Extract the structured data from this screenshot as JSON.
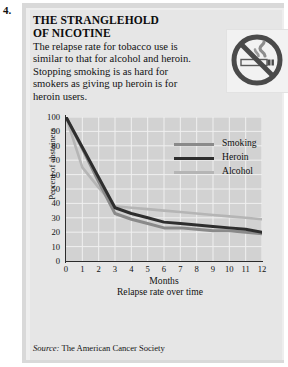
{
  "item_number": "4.",
  "panel": {
    "title": "THE STRANGLEHOLD OF NICOTINE",
    "title_line1": "THE STRANGLEHOLD",
    "title_line2": "OF NICOTINE",
    "body": "The relapse rate for tobacco use is similar to that for alcohol and heroin. Stopping smoking is as hard for smokers as giving up heroin is for heroin users.",
    "icon_name": "no-smoking-icon",
    "source_prefix": "Source:",
    "source_text": "The American Cancer Society"
  },
  "colors": {
    "panel_bg": "#e6e6e6",
    "plot_bg": "#d2d2d2",
    "grid": "#f0f0f0",
    "axis": "#2b2b2b",
    "smoking": "#8a8a8a",
    "heroin": "#2e2e2e",
    "alcohol": "#b5b5b5"
  },
  "chart_data": {
    "type": "line",
    "title": "",
    "xlabel": "Months",
    "xsubtitle": "Relapse rate over time",
    "ylabel": "Percent of abstainers",
    "xlim": [
      0,
      12
    ],
    "ylim": [
      0,
      100
    ],
    "xticks": [
      0,
      1,
      2,
      3,
      4,
      5,
      6,
      7,
      8,
      9,
      10,
      11,
      12
    ],
    "yticks": [
      0,
      10,
      20,
      30,
      40,
      50,
      60,
      70,
      80,
      90,
      100
    ],
    "grid": true,
    "legend_position": "upper-right-inside",
    "x": [
      0,
      1,
      2,
      3,
      4,
      5,
      6,
      7,
      8,
      9,
      10,
      11,
      12
    ],
    "series": [
      {
        "name": "Smoking",
        "color": "#8a8a8a",
        "values": [
          100,
          78,
          55,
          33,
          29,
          26,
          23,
          23,
          22,
          21,
          21,
          20,
          19
        ]
      },
      {
        "name": "Heroin",
        "color": "#2e2e2e",
        "values": [
          100,
          79,
          58,
          37,
          33,
          30,
          27,
          26,
          25,
          24,
          23,
          22,
          20
        ]
      },
      {
        "name": "Alcohol",
        "color": "#b5b5b5",
        "values": [
          100,
          65,
          51,
          38,
          37,
          36,
          35,
          34,
          33,
          32,
          31,
          30,
          29
        ]
      }
    ]
  }
}
